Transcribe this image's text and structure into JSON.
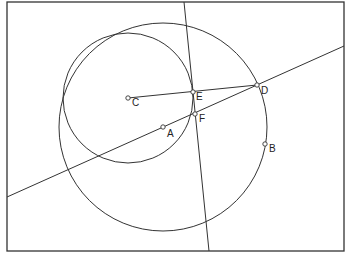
{
  "diagram": {
    "frame": {
      "x": 7,
      "y": 2,
      "width": 337,
      "height": 249,
      "stroke": "#333333"
    },
    "stroke_color": "#333333",
    "points": [
      {
        "id": "A",
        "label": "A",
        "x": 163,
        "y": 127,
        "lx": 167,
        "ly": 137
      },
      {
        "id": "B",
        "label": "B",
        "x": 265,
        "y": 144,
        "lx": 269,
        "ly": 152
      },
      {
        "id": "C",
        "label": "C",
        "x": 128,
        "y": 98,
        "lx": 132,
        "ly": 106
      },
      {
        "id": "D",
        "label": "D",
        "x": 257,
        "y": 85,
        "lx": 261,
        "ly": 94
      },
      {
        "id": "E",
        "label": "E",
        "x": 193,
        "y": 92,
        "lx": 196,
        "ly": 100
      },
      {
        "id": "F",
        "label": "F",
        "x": 195,
        "y": 114,
        "lx": 199,
        "ly": 122
      }
    ],
    "circles": [
      {
        "name": "large-circle",
        "cx": 163,
        "cy": 127,
        "r": 104
      },
      {
        "name": "small-circle",
        "cx": 128,
        "cy": 98,
        "r": 65
      }
    ],
    "lines": [
      {
        "name": "line-through-A-D",
        "x1": 7,
        "y1": 197,
        "x2": 344,
        "y2": 46
      },
      {
        "name": "line-through-E-F",
        "x1": 184,
        "y1": 2,
        "x2": 209,
        "y2": 251
      },
      {
        "name": "segment-C-D",
        "x1": 128,
        "y1": 98,
        "x2": 257,
        "y2": 85
      }
    ]
  },
  "caption": ""
}
